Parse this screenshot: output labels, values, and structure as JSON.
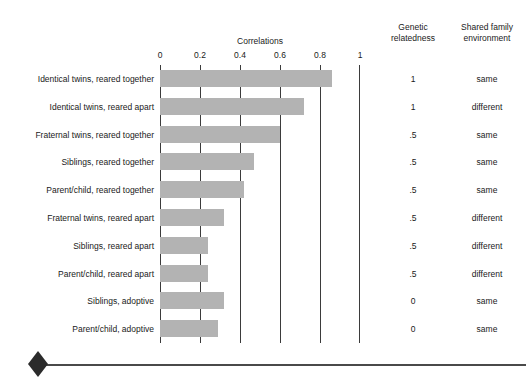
{
  "headers": {
    "genetic": "Genetic\nrelatedness",
    "genetic_line1": "Genetic",
    "genetic_line2": "relatedness",
    "shared_line1": "Shared family",
    "shared_line2": "environment"
  },
  "chart_data": {
    "type": "bar",
    "orientation": "horizontal",
    "title": "Correlations",
    "xlabel": "",
    "ylabel": "",
    "xlim": [
      0,
      1
    ],
    "ticks": [
      "0",
      "0.2",
      "0.4",
      "0.6",
      "0.8",
      "1"
    ],
    "tick_values": [
      0,
      0.2,
      0.4,
      0.6,
      0.8,
      1
    ],
    "grid": true,
    "grid_axis": "x",
    "legend": "none",
    "bar_color": "#b3b3b3",
    "categories": [
      "Identical twins, reared together",
      "Identical twins, reared apart",
      "Fraternal twins, reared together",
      "Siblings, reared together",
      "Parent/child, reared together",
      "Fraternal twins, reared apart",
      "Siblings, reared apart",
      "Parent/child, reared apart",
      "Siblings, adoptive",
      "Parent/child, adoptive"
    ],
    "values": [
      0.86,
      0.72,
      0.6,
      0.47,
      0.42,
      0.32,
      0.24,
      0.24,
      0.32,
      0.29
    ],
    "annotations": {
      "genetic_relatedness": [
        "1",
        "1",
        ".5",
        ".5",
        ".5",
        ".5",
        ".5",
        ".5",
        "0",
        "0"
      ],
      "shared_family_environment": [
        "same",
        "different",
        "same",
        "same",
        "same",
        "different",
        "different",
        "different",
        "same",
        "same"
      ]
    }
  }
}
